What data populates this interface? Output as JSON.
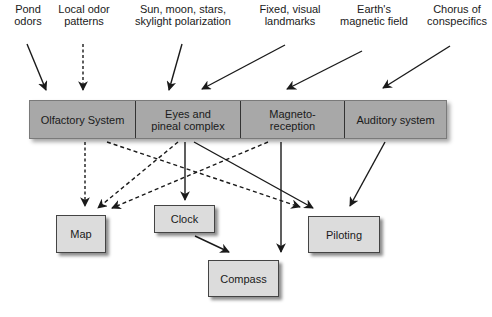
{
  "diagram": {
    "cues": [
      {
        "id": "pond-odors",
        "lines": [
          "Pond",
          "odors"
        ]
      },
      {
        "id": "local-odor-patterns",
        "lines": [
          "Local odor",
          "patterns"
        ]
      },
      {
        "id": "celestial",
        "lines": [
          "Sun, moon, stars,",
          "skylight polarization"
        ]
      },
      {
        "id": "landmarks",
        "lines": [
          "Fixed, visual",
          "landmarks"
        ]
      },
      {
        "id": "magnetic-field",
        "lines": [
          "Earth's",
          "magnetic field"
        ]
      },
      {
        "id": "conspecifics",
        "lines": [
          "Chorus of",
          "conspecifics"
        ]
      }
    ],
    "systems": [
      {
        "id": "olfactory",
        "lines": [
          "Olfactory System"
        ]
      },
      {
        "id": "eyes-pineal",
        "lines": [
          "Eyes and",
          "pineal complex"
        ]
      },
      {
        "id": "magnetoreception",
        "lines": [
          "Magneto-",
          "reception"
        ]
      },
      {
        "id": "auditory",
        "lines": [
          "Auditory system"
        ]
      }
    ],
    "outputs": {
      "map": "Map",
      "clock": "Clock",
      "compass": "Compass",
      "piloting": "Piloting"
    },
    "connections": [
      {
        "from": "Pond odors",
        "to": "Olfactory System",
        "style": "solid"
      },
      {
        "from": "Local odor patterns",
        "to": "Olfactory System",
        "style": "dashed"
      },
      {
        "from": "Sun, moon, stars, skylight polarization",
        "to": "Eyes and pineal complex",
        "style": "solid"
      },
      {
        "from": "Fixed, visual landmarks",
        "to": "Eyes and pineal complex",
        "style": "solid"
      },
      {
        "from": "Earth's magnetic field",
        "to": "Magneto-reception",
        "style": "solid"
      },
      {
        "from": "Chorus of conspecifics",
        "to": "Auditory system",
        "style": "solid"
      },
      {
        "from": "Olfactory System",
        "to": "Map",
        "style": "dashed"
      },
      {
        "from": "Olfactory System",
        "to": "Piloting",
        "style": "dashed"
      },
      {
        "from": "Eyes and pineal complex",
        "to": "Map",
        "style": "dashed"
      },
      {
        "from": "Eyes and pineal complex",
        "to": "Clock",
        "style": "solid"
      },
      {
        "from": "Eyes and pineal complex",
        "to": "Piloting",
        "style": "solid"
      },
      {
        "from": "Magneto-reception",
        "to": "Map",
        "style": "dashed"
      },
      {
        "from": "Magneto-reception",
        "to": "Compass",
        "style": "solid"
      },
      {
        "from": "Auditory system",
        "to": "Piloting",
        "style": "solid"
      },
      {
        "from": "Clock",
        "to": "Compass",
        "style": "solid"
      }
    ],
    "colors": {
      "bar_fill": "#a8a8a8",
      "box_fill": "#dcdcdc",
      "line": "#1a1a1a"
    }
  }
}
